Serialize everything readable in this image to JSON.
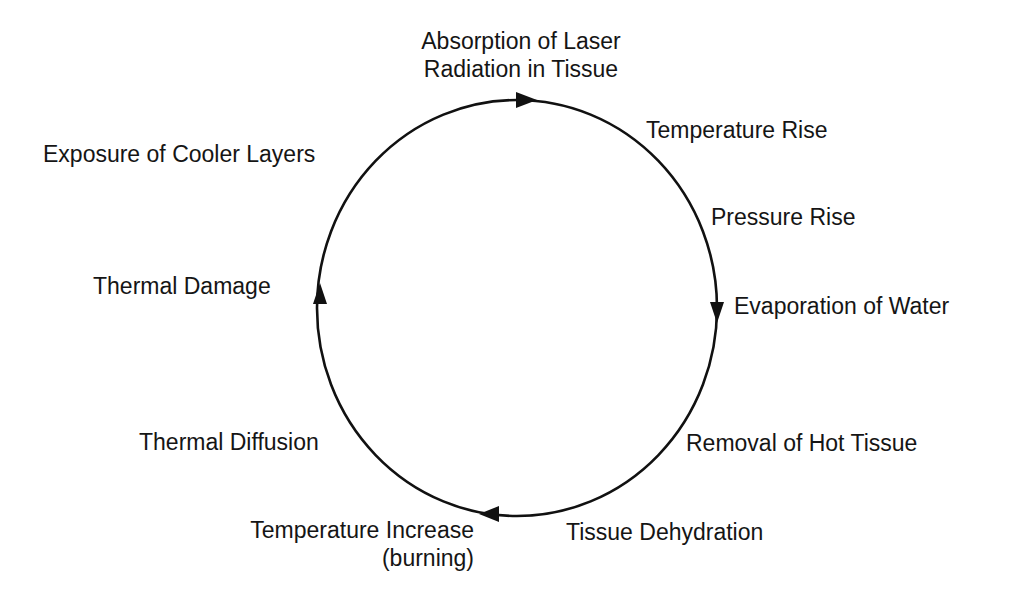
{
  "diagram": {
    "type": "cycle",
    "direction": "clockwise",
    "stroke_color": "#111111",
    "background": "#ffffff",
    "labels": {
      "absorption_line1": "Absorption of Laser",
      "absorption_line2": "Radiation in Tissue",
      "temperature_rise": "Temperature Rise",
      "pressure_rise": "Pressure Rise",
      "evaporation": "Evaporation of Water",
      "removal": "Removal of Hot Tissue",
      "dehydration": "Tissue Dehydration",
      "temp_increase_line1": "Temperature Increase",
      "temp_increase_line2": "(burning)",
      "thermal_diffusion": "Thermal Diffusion",
      "thermal_damage": "Thermal Damage",
      "exposure": "Exposure of Cooler Layers"
    },
    "sequence": [
      "Absorption of Laser Radiation in Tissue",
      "Temperature Rise",
      "Pressure Rise",
      "Evaporation of Water",
      "Removal of Hot Tissue",
      "Tissue Dehydration",
      "Temperature Increase (burning)",
      "Thermal Diffusion",
      "Thermal Damage",
      "Exposure of Cooler Layers"
    ]
  }
}
